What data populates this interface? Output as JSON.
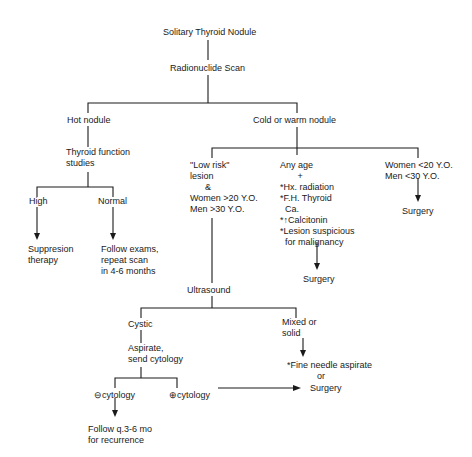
{
  "diagram": {
    "title": "Solitary Thyroid Nodule",
    "nodes": {
      "root": "Solitary Thyroid Nodule",
      "scan": "Radionuclide Scan",
      "hot": "Hot nodule",
      "tfs": "Thyroid function\nstudies",
      "high": "High",
      "normal": "Normal",
      "suppression": "Suppresion\ntherapy",
      "follow_exams": "Follow exams,\nrepeat scan\nin 4-6 months",
      "cold": "Cold or warm nodule",
      "low_risk": "\"Low risk\"\nlesion\n      &\nWomen >20 Y.O.\nMen >30 Y.O.",
      "any_age": "Any age\n       +\n*Hx. radiation\n*F.H. Thyroid\n  Ca.\n*↑Calcitonin\n*Lesion suspicious\n  for malignancy",
      "surgery_mid": "Surgery",
      "young": "Women <20 Y.O.\nMen <30 Y.O.",
      "surgery_right": "Surgery",
      "ultrasound": "Ultrasound",
      "cystic": "Cystic",
      "aspirate": "Aspirate,\nsend cytology",
      "neg_cytology": "⊖cytology",
      "pos_cytology": "⊕cytology",
      "follow_q": "Follow q.3-6 mo\nfor recurrence",
      "mixed": "Mixed or\nsolid",
      "fna": "*Fine needle aspirate\n            or",
      "surgery_bottom": "Surgery"
    }
  }
}
